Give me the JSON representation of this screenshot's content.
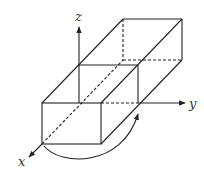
{
  "diagram": {
    "title": "",
    "axes": {
      "x": {
        "label": "x"
      },
      "y": {
        "label": "y"
      },
      "z": {
        "label": "z"
      }
    },
    "shape": "rectangular-prism",
    "annotations": [
      "curved rotation arrow from front-bottom-left corner to right-front edge"
    ],
    "colors": {
      "stroke": "#222222",
      "background": "#ffffff"
    }
  }
}
